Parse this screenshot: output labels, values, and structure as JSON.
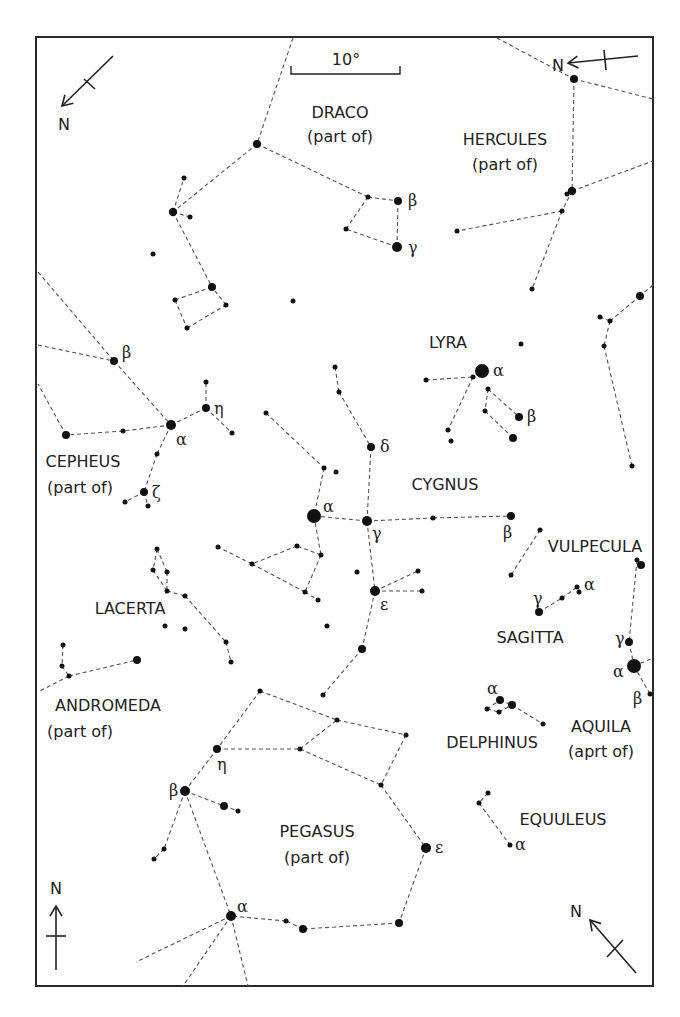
{
  "frame": {
    "x": 36,
    "y": 37,
    "w": 617,
    "h": 949
  },
  "scale_bar": {
    "label": "10°",
    "x1": 291,
    "x2": 400,
    "y": 74,
    "label_x": 346,
    "label_y": 65
  },
  "north_arrows": [
    {
      "label": "N",
      "pos": "top-left",
      "x1": 113,
      "y1": 56,
      "x2": 62,
      "y2": 106,
      "tick": [
        84,
        79,
        95,
        89
      ],
      "lx": 64,
      "ly": 130
    },
    {
      "label": "N",
      "pos": "top-right",
      "x1": 638,
      "y1": 56,
      "x2": 568,
      "y2": 63,
      "tick": [
        604,
        50,
        606,
        70
      ],
      "lx": 558,
      "ly": 71
    },
    {
      "label": "N",
      "pos": "bottom-left",
      "x1": 56,
      "y1": 970,
      "x2": 56,
      "y2": 906,
      "tick": [
        46,
        936,
        66,
        936
      ],
      "lx": 56,
      "ly": 894
    },
    {
      "label": "N",
      "pos": "bottom-right",
      "x1": 636,
      "y1": 973,
      "x2": 590,
      "y2": 920,
      "tick": [
        607,
        957,
        623,
        940
      ],
      "lx": 576,
      "ly": 917
    }
  ],
  "constellations": [
    {
      "name": "DRACO",
      "sub": "(part of)",
      "lx": 340,
      "ly": 118,
      "sx": 340,
      "sy": 142
    },
    {
      "name": "HERCULES",
      "sub": "(part of)",
      "lx": 505,
      "ly": 145,
      "sx": 505,
      "sy": 170
    },
    {
      "name": "LYRA",
      "sub": "",
      "lx": 448,
      "ly": 348,
      "sx": 0,
      "sy": 0
    },
    {
      "name": "CEPHEUS",
      "sub": "(part of)",
      "lx": 83,
      "ly": 467,
      "sx": 80,
      "sy": 493
    },
    {
      "name": "CYGNUS",
      "sub": "",
      "lx": 445,
      "ly": 490,
      "sx": 0,
      "sy": 0
    },
    {
      "name": "VULPECULA",
      "sub": "",
      "lx": 595,
      "ly": 552,
      "sx": 0,
      "sy": 0
    },
    {
      "name": "SAGITTA",
      "sub": "",
      "lx": 530,
      "ly": 643,
      "sx": 0,
      "sy": 0
    },
    {
      "name": "LACERTA",
      "sub": "",
      "lx": 130,
      "ly": 614,
      "sx": 0,
      "sy": 0
    },
    {
      "name": "ANDROMEDA",
      "sub": "(part of)",
      "lx": 108,
      "ly": 711,
      "sx": 80,
      "sy": 737
    },
    {
      "name": "DELPHINUS",
      "sub": "",
      "lx": 492,
      "ly": 748,
      "sx": 0,
      "sy": 0
    },
    {
      "name": "AQUILA",
      "sub": "(aprt of)",
      "lx": 601,
      "ly": 732,
      "sx": 601,
      "sy": 757
    },
    {
      "name": "EQUULEUS",
      "sub": "",
      "lx": 563,
      "ly": 825,
      "sx": 0,
      "sy": 0
    },
    {
      "name": "PEGASUS",
      "sub": "(part of)",
      "lx": 317,
      "ly": 837,
      "sx": 317,
      "sy": 863
    }
  ],
  "stars": [
    {
      "x": 257,
      "y": 144,
      "r": 4
    },
    {
      "x": 173,
      "y": 212,
      "r": 4.2
    },
    {
      "x": 184,
      "y": 178,
      "r": 2.5
    },
    {
      "x": 190,
      "y": 217,
      "r": 2.5
    },
    {
      "x": 153,
      "y": 254,
      "r": 2.5
    },
    {
      "x": 212,
      "y": 287,
      "r": 4
    },
    {
      "x": 175,
      "y": 300,
      "r": 2.5
    },
    {
      "x": 226,
      "y": 305,
      "r": 2.5
    },
    {
      "x": 187,
      "y": 328,
      "r": 2.5
    },
    {
      "x": 293,
      "y": 301,
      "r": 2.5
    },
    {
      "x": 368,
      "y": 197,
      "r": 2.5
    },
    {
      "x": 398,
      "y": 201,
      "r": 4
    },
    {
      "x": 346,
      "y": 229,
      "r": 2.5
    },
    {
      "x": 397,
      "y": 247,
      "r": 5
    },
    {
      "x": 574,
      "y": 79,
      "r": 4
    },
    {
      "x": 572,
      "y": 191,
      "r": 4.2
    },
    {
      "x": 567,
      "y": 194,
      "r": 2.5
    },
    {
      "x": 562,
      "y": 211,
      "r": 2.5
    },
    {
      "x": 457,
      "y": 231,
      "r": 2.5
    },
    {
      "x": 532,
      "y": 289,
      "r": 2.5
    },
    {
      "x": 640,
      "y": 296,
      "r": 4
    },
    {
      "x": 600,
      "y": 317,
      "r": 2.5
    },
    {
      "x": 610,
      "y": 321,
      "r": 2.5
    },
    {
      "x": 604,
      "y": 346,
      "r": 2.5
    },
    {
      "x": 632,
      "y": 466,
      "r": 2.5
    },
    {
      "x": 521,
      "y": 344,
      "r": 2.5
    },
    {
      "x": 482,
      "y": 371,
      "r": 7
    },
    {
      "x": 473,
      "y": 377,
      "r": 2.5
    },
    {
      "x": 426,
      "y": 380,
      "r": 2.5
    },
    {
      "x": 488,
      "y": 389,
      "r": 2.5
    },
    {
      "x": 485,
      "y": 411,
      "r": 2.5
    },
    {
      "x": 519,
      "y": 417,
      "r": 4
    },
    {
      "x": 513,
      "y": 438,
      "r": 4
    },
    {
      "x": 448,
      "y": 430,
      "r": 2.5
    },
    {
      "x": 451,
      "y": 441,
      "r": 2.5
    },
    {
      "x": 114,
      "y": 361,
      "r": 4
    },
    {
      "x": 171,
      "y": 425,
      "r": 5
    },
    {
      "x": 206,
      "y": 408,
      "r": 4
    },
    {
      "x": 206,
      "y": 382,
      "r": 2.5
    },
    {
      "x": 232,
      "y": 433,
      "r": 2.5
    },
    {
      "x": 66,
      "y": 435,
      "r": 4
    },
    {
      "x": 123,
      "y": 431,
      "r": 2.5
    },
    {
      "x": 157,
      "y": 454,
      "r": 2.5
    },
    {
      "x": 144,
      "y": 492,
      "r": 4
    },
    {
      "x": 125,
      "y": 502,
      "r": 2.5
    },
    {
      "x": 148,
      "y": 506,
      "r": 2.5
    },
    {
      "x": 335,
      "y": 367,
      "r": 2.5
    },
    {
      "x": 339,
      "y": 392,
      "r": 2.5
    },
    {
      "x": 371,
      "y": 447,
      "r": 4
    },
    {
      "x": 266,
      "y": 413,
      "r": 2.5
    },
    {
      "x": 324,
      "y": 468,
      "r": 2.5
    },
    {
      "x": 336,
      "y": 472,
      "r": 2.5
    },
    {
      "x": 314,
      "y": 516,
      "r": 7
    },
    {
      "x": 367,
      "y": 521,
      "r": 5
    },
    {
      "x": 433,
      "y": 518,
      "r": 2.5
    },
    {
      "x": 511,
      "y": 516,
      "r": 4
    },
    {
      "x": 321,
      "y": 555,
      "r": 2.5
    },
    {
      "x": 297,
      "y": 546,
      "r": 2.5
    },
    {
      "x": 252,
      "y": 564,
      "r": 2.5
    },
    {
      "x": 218,
      "y": 547,
      "r": 2.5
    },
    {
      "x": 305,
      "y": 592,
      "r": 2.5
    },
    {
      "x": 318,
      "y": 600,
      "r": 2.5
    },
    {
      "x": 327,
      "y": 626,
      "r": 2.5
    },
    {
      "x": 357,
      "y": 572,
      "r": 2.5
    },
    {
      "x": 375,
      "y": 591,
      "r": 5
    },
    {
      "x": 418,
      "y": 571,
      "r": 2.5
    },
    {
      "x": 422,
      "y": 591,
      "r": 2.5
    },
    {
      "x": 362,
      "y": 649,
      "r": 4
    },
    {
      "x": 323,
      "y": 695,
      "r": 2.5
    },
    {
      "x": 540,
      "y": 530,
      "r": 2.5
    },
    {
      "x": 511,
      "y": 575,
      "r": 2.5
    },
    {
      "x": 539,
      "y": 612,
      "r": 4
    },
    {
      "x": 562,
      "y": 598,
      "r": 2.5
    },
    {
      "x": 577,
      "y": 587,
      "r": 2.5
    },
    {
      "x": 579,
      "y": 592,
      "r": 2.5
    },
    {
      "x": 637,
      "y": 560,
      "r": 2.5
    },
    {
      "x": 641,
      "y": 565,
      "r": 4
    },
    {
      "x": 629,
      "y": 642,
      "r": 4
    },
    {
      "x": 634,
      "y": 666,
      "r": 7
    },
    {
      "x": 650,
      "y": 694,
      "r": 2.5
    },
    {
      "x": 500,
      "y": 700,
      "r": 4
    },
    {
      "x": 512,
      "y": 705,
      "r": 4
    },
    {
      "x": 487,
      "y": 709,
      "r": 2.5
    },
    {
      "x": 499,
      "y": 712,
      "r": 2.5
    },
    {
      "x": 543,
      "y": 724,
      "r": 2.5
    },
    {
      "x": 157,
      "y": 549,
      "r": 2.5
    },
    {
      "x": 153,
      "y": 570,
      "r": 2.5
    },
    {
      "x": 167,
      "y": 572,
      "r": 2.5
    },
    {
      "x": 167,
      "y": 591,
      "r": 2.5
    },
    {
      "x": 185,
      "y": 596,
      "r": 2.5
    },
    {
      "x": 226,
      "y": 642,
      "r": 2.5
    },
    {
      "x": 231,
      "y": 662,
      "r": 2.5
    },
    {
      "x": 165,
      "y": 626,
      "r": 2.5
    },
    {
      "x": 185,
      "y": 629,
      "r": 2.5
    },
    {
      "x": 63,
      "y": 645,
      "r": 2.5
    },
    {
      "x": 62,
      "y": 666,
      "r": 2.5
    },
    {
      "x": 69,
      "y": 676,
      "r": 2.5
    },
    {
      "x": 137,
      "y": 660,
      "r": 4
    },
    {
      "x": 260,
      "y": 691,
      "r": 2.5
    },
    {
      "x": 337,
      "y": 720,
      "r": 2.5
    },
    {
      "x": 406,
      "y": 735,
      "r": 2.5
    },
    {
      "x": 217,
      "y": 749,
      "r": 4
    },
    {
      "x": 300,
      "y": 749,
      "r": 2.5
    },
    {
      "x": 381,
      "y": 785,
      "r": 2.5
    },
    {
      "x": 185,
      "y": 791,
      "r": 5
    },
    {
      "x": 224,
      "y": 806,
      "r": 4
    },
    {
      "x": 238,
      "y": 811,
      "r": 2.5
    },
    {
      "x": 154,
      "y": 859,
      "r": 2.5
    },
    {
      "x": 164,
      "y": 849,
      "r": 2.5
    },
    {
      "x": 426,
      "y": 848,
      "r": 5
    },
    {
      "x": 399,
      "y": 923,
      "r": 4
    },
    {
      "x": 231,
      "y": 916,
      "r": 5
    },
    {
      "x": 286,
      "y": 921,
      "r": 2.5
    },
    {
      "x": 303,
      "y": 929,
      "r": 4
    },
    {
      "x": 488,
      "y": 793,
      "r": 2.5
    },
    {
      "x": 479,
      "y": 803,
      "r": 2.5
    },
    {
      "x": 510,
      "y": 845,
      "r": 2.5
    }
  ],
  "lines": [
    [
      293,
      38,
      257,
      144
    ],
    [
      257,
      144,
      368,
      197
    ],
    [
      368,
      197,
      398,
      201
    ],
    [
      398,
      201,
      397,
      247
    ],
    [
      397,
      247,
      346,
      229
    ],
    [
      346,
      229,
      368,
      197
    ],
    [
      257,
      144,
      173,
      212
    ],
    [
      173,
      212,
      184,
      178
    ],
    [
      173,
      212,
      190,
      217
    ],
    [
      173,
      212,
      212,
      287
    ],
    [
      212,
      287,
      175,
      300
    ],
    [
      175,
      300,
      187,
      328
    ],
    [
      187,
      328,
      226,
      305
    ],
    [
      226,
      305,
      212,
      287
    ],
    [
      497,
      38,
      574,
      79
    ],
    [
      574,
      79,
      653,
      99
    ],
    [
      574,
      79,
      572,
      191
    ],
    [
      572,
      191,
      653,
      161
    ],
    [
      572,
      191,
      562,
      211
    ],
    [
      562,
      211,
      457,
      231
    ],
    [
      562,
      211,
      532,
      289
    ],
    [
      653,
      285,
      640,
      296
    ],
    [
      640,
      296,
      610,
      321
    ],
    [
      610,
      321,
      600,
      317
    ],
    [
      610,
      321,
      604,
      346
    ],
    [
      604,
      346,
      632,
      466
    ],
    [
      426,
      380,
      473,
      377
    ],
    [
      473,
      377,
      448,
      430
    ],
    [
      488,
      389,
      519,
      417
    ],
    [
      488,
      389,
      485,
      411
    ],
    [
      485,
      411,
      513,
      438
    ],
    [
      38,
      272,
      114,
      361
    ],
    [
      38,
      345,
      114,
      361
    ],
    [
      114,
      361,
      171,
      425
    ],
    [
      171,
      425,
      206,
      408
    ],
    [
      206,
      408,
      206,
      382
    ],
    [
      206,
      408,
      232,
      433
    ],
    [
      171,
      425,
      123,
      431
    ],
    [
      123,
      431,
      66,
      435
    ],
    [
      66,
      435,
      38,
      384
    ],
    [
      171,
      425,
      157,
      454
    ],
    [
      157,
      454,
      144,
      492
    ],
    [
      144,
      492,
      125,
      502
    ],
    [
      144,
      492,
      148,
      506
    ],
    [
      335,
      367,
      339,
      392
    ],
    [
      339,
      392,
      371,
      447
    ],
    [
      371,
      447,
      367,
      521
    ],
    [
      266,
      413,
      324,
      468
    ],
    [
      324,
      468,
      314,
      516
    ],
    [
      314,
      516,
      367,
      521
    ],
    [
      367,
      521,
      433,
      518
    ],
    [
      433,
      518,
      511,
      516
    ],
    [
      314,
      516,
      321,
      555
    ],
    [
      321,
      555,
      297,
      546
    ],
    [
      297,
      546,
      252,
      564
    ],
    [
      252,
      564,
      218,
      547
    ],
    [
      252,
      564,
      305,
      592
    ],
    [
      305,
      592,
      318,
      600
    ],
    [
      321,
      555,
      305,
      592
    ],
    [
      367,
      521,
      375,
      591
    ],
    [
      375,
      591,
      418,
      571
    ],
    [
      375,
      591,
      422,
      591
    ],
    [
      375,
      591,
      362,
      649
    ],
    [
      362,
      649,
      323,
      695
    ],
    [
      540,
      530,
      511,
      575
    ],
    [
      539,
      612,
      562,
      598
    ],
    [
      562,
      598,
      577,
      587
    ],
    [
      637,
      560,
      629,
      642
    ],
    [
      629,
      642,
      634,
      666
    ],
    [
      634,
      666,
      650,
      694
    ],
    [
      634,
      666,
      653,
      658
    ],
    [
      487,
      709,
      500,
      700
    ],
    [
      500,
      700,
      512,
      705
    ],
    [
      512,
      705,
      543,
      724
    ],
    [
      487,
      709,
      499,
      712
    ],
    [
      499,
      712,
      512,
      705
    ],
    [
      157,
      549,
      153,
      570
    ],
    [
      153,
      570,
      167,
      591
    ],
    [
      157,
      549,
      167,
      572
    ],
    [
      167,
      572,
      167,
      591
    ],
    [
      167,
      591,
      185,
      596
    ],
    [
      185,
      596,
      226,
      642
    ],
    [
      226,
      642,
      231,
      662
    ],
    [
      63,
      645,
      62,
      666
    ],
    [
      62,
      666,
      69,
      676
    ],
    [
      69,
      676,
      137,
      660
    ],
    [
      69,
      676,
      38,
      692
    ],
    [
      260,
      691,
      337,
      720
    ],
    [
      337,
      720,
      406,
      735
    ],
    [
      406,
      735,
      381,
      785
    ],
    [
      260,
      691,
      217,
      749
    ],
    [
      217,
      749,
      300,
      749
    ],
    [
      300,
      749,
      337,
      720
    ],
    [
      300,
      749,
      381,
      785
    ],
    [
      381,
      785,
      426,
      848
    ],
    [
      426,
      848,
      399,
      923
    ],
    [
      399,
      923,
      303,
      929
    ],
    [
      303,
      929,
      286,
      921
    ],
    [
      286,
      921,
      231,
      916
    ],
    [
      217,
      749,
      185,
      791
    ],
    [
      185,
      791,
      224,
      806
    ],
    [
      224,
      806,
      238,
      811
    ],
    [
      185,
      791,
      164,
      849
    ],
    [
      164,
      849,
      154,
      859
    ],
    [
      185,
      791,
      231,
      916
    ],
    [
      231,
      916,
      136,
      962
    ],
    [
      231,
      916,
      183,
      986
    ],
    [
      231,
      916,
      248,
      986
    ],
    [
      488,
      793,
      479,
      803
    ],
    [
      479,
      803,
      510,
      845
    ]
  ],
  "greek_labels": [
    {
      "t": "β",
      "x": 408,
      "y": 206
    },
    {
      "t": "γ",
      "x": 408,
      "y": 253
    },
    {
      "t": "α",
      "x": 493,
      "y": 376
    },
    {
      "t": "β",
      "x": 527,
      "y": 422
    },
    {
      "t": "β",
      "x": 122,
      "y": 358
    },
    {
      "t": "η",
      "x": 214,
      "y": 414
    },
    {
      "t": "α",
      "x": 176,
      "y": 445
    },
    {
      "t": "ζ",
      "x": 152,
      "y": 498
    },
    {
      "t": "δ",
      "x": 380,
      "y": 452
    },
    {
      "t": "α",
      "x": 323,
      "y": 512
    },
    {
      "t": "γ",
      "x": 372,
      "y": 539
    },
    {
      "t": "β",
      "x": 503,
      "y": 538
    },
    {
      "t": "ε",
      "x": 380,
      "y": 610
    },
    {
      "t": "γ",
      "x": 533,
      "y": 604
    },
    {
      "t": "α",
      "x": 584,
      "y": 590
    },
    {
      "t": "γ",
      "x": 615,
      "y": 644
    },
    {
      "t": "α",
      "x": 613,
      "y": 677
    },
    {
      "t": "β",
      "x": 633,
      "y": 704
    },
    {
      "t": "α",
      "x": 487,
      "y": 694
    },
    {
      "t": "η",
      "x": 217,
      "y": 770
    },
    {
      "t": "β",
      "x": 169,
      "y": 796
    },
    {
      "t": "ε",
      "x": 435,
      "y": 853
    },
    {
      "t": "α",
      "x": 237,
      "y": 912
    },
    {
      "t": "α",
      "x": 515,
      "y": 850
    }
  ],
  "colors": {
    "ink": "#111111",
    "line": "#555555",
    "background": "#ffffff"
  }
}
